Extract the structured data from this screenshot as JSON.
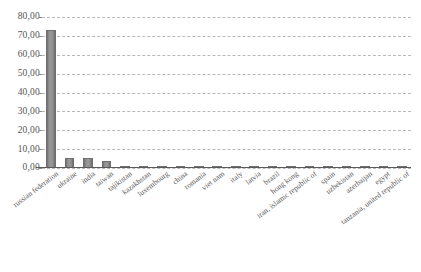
{
  "chart_data": {
    "type": "bar",
    "title": "",
    "subtitle": "",
    "xlabel": "",
    "ylabel": "",
    "ylim": [
      0,
      80
    ],
    "grid": true,
    "legend": "none",
    "decimal_separator": ",",
    "y_ticks": [
      "0,00",
      "10,00",
      "20,00",
      "30,00",
      "40,00",
      "50,00",
      "60,00",
      "70,00",
      "80,00"
    ],
    "y_tick_values": [
      0,
      10,
      20,
      30,
      40,
      50,
      60,
      70,
      80
    ],
    "bar_color": "#8e8e8e",
    "categories": [
      "russian federation",
      "ukraine",
      "india",
      "taiwan",
      "tajikistan",
      "kazakhstan",
      "luxembourg",
      "china",
      "romania",
      "viet nam",
      "italy",
      "latvia",
      "brazil",
      "hong kong",
      "iran, islamic republic of",
      "spain",
      "uzbekistan",
      "azerbaijan",
      "egypt",
      "tanzania, united republic of"
    ],
    "values": [
      73.0,
      5.3,
      5.1,
      3.6,
      1.2,
      1.0,
      0.9,
      0.8,
      0.8,
      0.7,
      0.7,
      0.6,
      0.6,
      0.5,
      0.5,
      0.5,
      0.4,
      0.4,
      0.4,
      0.3
    ]
  }
}
